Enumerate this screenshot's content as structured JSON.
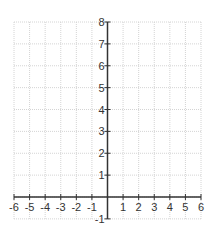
{
  "chart_data": {
    "type": "scatter",
    "title": "",
    "xlabel": "",
    "ylabel": "",
    "xlim": [
      -6,
      6
    ],
    "ylim": [
      -1,
      8
    ],
    "grid": true,
    "x_ticks": [
      -6,
      -5,
      -4,
      -3,
      -2,
      -1,
      1,
      2,
      3,
      4,
      5,
      6
    ],
    "y_ticks": [
      -1,
      1,
      2,
      3,
      4,
      5,
      6,
      7,
      8
    ],
    "series": [],
    "legend": null
  },
  "colors": {
    "grid": "#d4d4d4",
    "axis": "#333333",
    "label": "#333333",
    "background": "#ffffff"
  }
}
